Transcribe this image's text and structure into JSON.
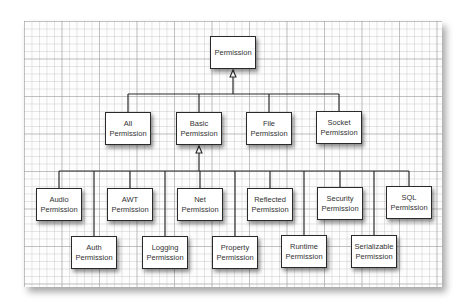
{
  "diagram": {
    "colors": {
      "line": "#2a2a2a",
      "box_fill": "#ffffff",
      "text": "#333333",
      "grid": "#b4b4b4"
    },
    "root": {
      "id": "permission",
      "lines": [
        "Permission"
      ]
    },
    "level1": [
      {
        "id": "all-permission",
        "lines": [
          "All",
          "Permission"
        ]
      },
      {
        "id": "basic-permission",
        "lines": [
          "Basic",
          "Permission"
        ]
      },
      {
        "id": "file-permission",
        "lines": [
          "File",
          "Permission"
        ]
      },
      {
        "id": "socket-permission",
        "lines": [
          "Socket",
          "Permission"
        ]
      }
    ],
    "level2_parent": "basic-permission",
    "level2": [
      {
        "id": "audio-permission",
        "lines": [
          "Audio",
          "Permission"
        ]
      },
      {
        "id": "auth-permission",
        "lines": [
          "Auth",
          "Permission"
        ]
      },
      {
        "id": "awt-permission",
        "lines": [
          "AWT",
          "Permission"
        ]
      },
      {
        "id": "logging-permission",
        "lines": [
          "Logging",
          "Permission"
        ]
      },
      {
        "id": "net-permission",
        "lines": [
          "Net",
          "Permission"
        ]
      },
      {
        "id": "property-permission",
        "lines": [
          "Property",
          "Permission"
        ]
      },
      {
        "id": "reflected-permission",
        "lines": [
          "Reflected",
          "Permission"
        ]
      },
      {
        "id": "runtime-permission",
        "lines": [
          "Runtime",
          "Permission"
        ]
      },
      {
        "id": "security-permission",
        "lines": [
          "Security",
          "Permission"
        ]
      },
      {
        "id": "serializable-permission",
        "lines": [
          "Serializable",
          "Permission"
        ]
      },
      {
        "id": "sql-permission",
        "lines": [
          "SQL",
          "Permission"
        ]
      }
    ],
    "edges": [
      {
        "from": "all-permission",
        "to": "permission",
        "type": "inheritance"
      },
      {
        "from": "basic-permission",
        "to": "permission",
        "type": "inheritance"
      },
      {
        "from": "file-permission",
        "to": "permission",
        "type": "inheritance"
      },
      {
        "from": "socket-permission",
        "to": "permission",
        "type": "inheritance"
      },
      {
        "from": "audio-permission",
        "to": "basic-permission",
        "type": "inheritance"
      },
      {
        "from": "auth-permission",
        "to": "basic-permission",
        "type": "inheritance"
      },
      {
        "from": "awt-permission",
        "to": "basic-permission",
        "type": "inheritance"
      },
      {
        "from": "logging-permission",
        "to": "basic-permission",
        "type": "inheritance"
      },
      {
        "from": "net-permission",
        "to": "basic-permission",
        "type": "inheritance"
      },
      {
        "from": "property-permission",
        "to": "basic-permission",
        "type": "inheritance"
      },
      {
        "from": "reflected-permission",
        "to": "basic-permission",
        "type": "inheritance"
      },
      {
        "from": "runtime-permission",
        "to": "basic-permission",
        "type": "inheritance"
      },
      {
        "from": "security-permission",
        "to": "basic-permission",
        "type": "inheritance"
      },
      {
        "from": "serializable-permission",
        "to": "basic-permission",
        "type": "inheritance"
      },
      {
        "from": "sql-permission",
        "to": "basic-permission",
        "type": "inheritance"
      }
    ]
  }
}
